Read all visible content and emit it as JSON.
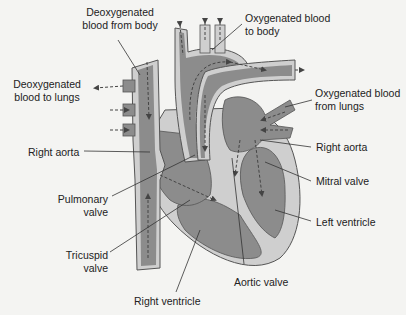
{
  "diagram": {
    "colors": {
      "blood": "#8c8c8c",
      "wall": "#cfcfcf",
      "outline": "#555555",
      "background": "#f4f4f2",
      "text": "#222222"
    },
    "labels": {
      "deoxy_from_body": [
        "Deoxygenated",
        "blood from body"
      ],
      "oxy_to_body": [
        "Oxygenated blood",
        "to body"
      ],
      "deoxy_to_lungs": [
        "Deoxygenated",
        "blood to lungs"
      ],
      "oxy_from_lungs": [
        "Oxygenated blood",
        "from lungs"
      ],
      "right_aorta_left": "Right aorta",
      "right_aorta_right": "Right aorta",
      "mitral_valve": "Mitral valve",
      "pulmonary_valve": [
        "Pulmonary",
        "valve"
      ],
      "left_ventricle": "Left ventricle",
      "tricuspid_valve": [
        "Tricuspid",
        "valve"
      ],
      "aortic_valve": "Aortic valve",
      "right_ventricle": "Right ventricle"
    }
  }
}
